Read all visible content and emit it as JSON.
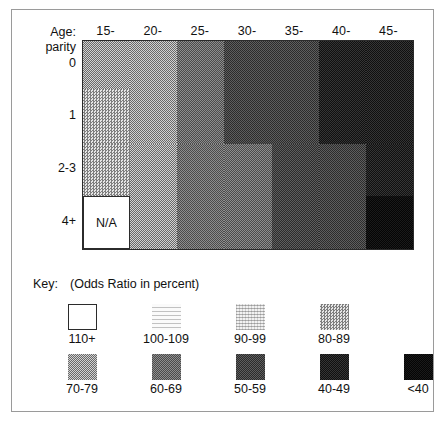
{
  "figure": {
    "axis": {
      "corner_line1": "Age:",
      "corner_line2": "parity",
      "col_labels": [
        "15-",
        "20-",
        "25-",
        "30-",
        "35-",
        "40-",
        "45-"
      ],
      "row_labels": [
        "0",
        "1",
        "2-3",
        "4+"
      ],
      "na_label": "N/A"
    },
    "key": {
      "word": "Key:",
      "caption": "(Odds Ratio in percent)",
      "entries": [
        {
          "label": "110+",
          "shade": 1,
          "color": "#ffffff"
        },
        {
          "label": "100-109",
          "shade": 2,
          "color": "#fafafa"
        },
        {
          "label": "90-99",
          "shade": 3,
          "color": "#f2f2f2"
        },
        {
          "label": "80-89",
          "shade": 4,
          "color": "#e6e6e6"
        },
        {
          "label": "70-79",
          "shade": 5,
          "color": "#d2d2d2"
        },
        {
          "label": "60-69",
          "shade": 6,
          "color": "#8e8e8e"
        },
        {
          "label": "50-59",
          "shade": 7,
          "color": "#5e5e5e"
        },
        {
          "label": "40-49",
          "shade": 8,
          "color": "#353535"
        },
        {
          "label": "<40",
          "shade": 9,
          "color": "#1a1a1a"
        }
      ]
    }
  },
  "chart_data": {
    "type": "heatmap",
    "title": "",
    "xlabel": "Age",
    "ylabel": "parity",
    "x": [
      "15-",
      "20-",
      "25-",
      "30-",
      "35-",
      "40-",
      "45-"
    ],
    "y": [
      "0",
      "1",
      "2-3",
      "4+"
    ],
    "value_unit": "Odds Ratio in percent",
    "scale_bins": [
      "110+",
      "100-109",
      "90-99",
      "80-89",
      "70-79",
      "60-69",
      "50-59",
      "40-49",
      "<40"
    ],
    "grid": false,
    "legend_position": "below",
    "cells": [
      {
        "row": "0",
        "col": "15-",
        "bin": "70-79",
        "shade": 5
      },
      {
        "row": "0",
        "col": "20-",
        "bin": "70-79",
        "shade": 5
      },
      {
        "row": "0",
        "col": "25-",
        "bin": "60-69",
        "shade": 6
      },
      {
        "row": "0",
        "col": "30-",
        "bin": "50-59",
        "shade": 7
      },
      {
        "row": "0",
        "col": "35-",
        "bin": "50-59",
        "shade": 7
      },
      {
        "row": "0",
        "col": "40-",
        "bin": "40-49",
        "shade": 8
      },
      {
        "row": "0",
        "col": "45-",
        "bin": "40-49",
        "shade": 8
      },
      {
        "row": "1",
        "col": "15-",
        "bin": "80-89",
        "shade": 4
      },
      {
        "row": "1",
        "col": "20-",
        "bin": "70-79",
        "shade": 5
      },
      {
        "row": "1",
        "col": "25-",
        "bin": "60-69",
        "shade": 6
      },
      {
        "row": "1",
        "col": "30-",
        "bin": "50-59",
        "shade": 7
      },
      {
        "row": "1",
        "col": "35-",
        "bin": "50-59",
        "shade": 7
      },
      {
        "row": "1",
        "col": "40-",
        "bin": "40-49",
        "shade": 8
      },
      {
        "row": "1",
        "col": "45-",
        "bin": "40-49",
        "shade": 8
      },
      {
        "row": "2-3",
        "col": "15-",
        "bin": "80-89",
        "shade": 4
      },
      {
        "row": "2-3",
        "col": "20-",
        "bin": "70-79",
        "shade": 5
      },
      {
        "row": "2-3",
        "col": "25-",
        "bin": "60-69",
        "shade": 6
      },
      {
        "row": "2-3",
        "col": "30-",
        "bin": "60-69",
        "shade": 6
      },
      {
        "row": "2-3",
        "col": "35-",
        "bin": "50-59",
        "shade": 7
      },
      {
        "row": "2-3",
        "col": "40-",
        "bin": "50-59",
        "shade": 7
      },
      {
        "row": "2-3",
        "col": "45-",
        "bin": "40-49",
        "shade": 8
      },
      {
        "row": "4+",
        "col": "15-",
        "bin": "N/A",
        "shade": 0
      },
      {
        "row": "4+",
        "col": "20-",
        "bin": "70-79",
        "shade": 5
      },
      {
        "row": "4+",
        "col": "25-",
        "bin": "60-69",
        "shade": 6
      },
      {
        "row": "4+",
        "col": "30-",
        "bin": "60-69",
        "shade": 6
      },
      {
        "row": "4+",
        "col": "35-",
        "bin": "50-59",
        "shade": 7
      },
      {
        "row": "4+",
        "col": "40-",
        "bin": "50-59",
        "shade": 7
      },
      {
        "row": "4+",
        "col": "45-",
        "bin": "<40",
        "shade": 9
      }
    ]
  }
}
